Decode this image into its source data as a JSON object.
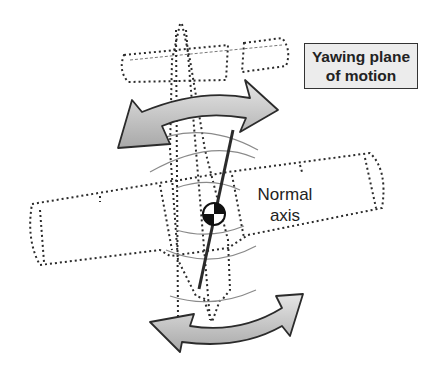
{
  "diagram": {
    "title_line1": "Yawing plane",
    "title_line2": "of motion",
    "axis_label_line1": "Normal",
    "axis_label_line2": "axis",
    "colors": {
      "arrow_fill": "#bdbdbd",
      "arrow_stroke": "#2b2b2b",
      "outline": "#2b2b2b",
      "arc": "#8a8a8a",
      "label_box": "#ececec"
    },
    "icons": [
      "double-curved-arrow-top",
      "double-curved-arrow-bottom",
      "center-of-gravity-symbol",
      "normal-axis-line"
    ]
  }
}
